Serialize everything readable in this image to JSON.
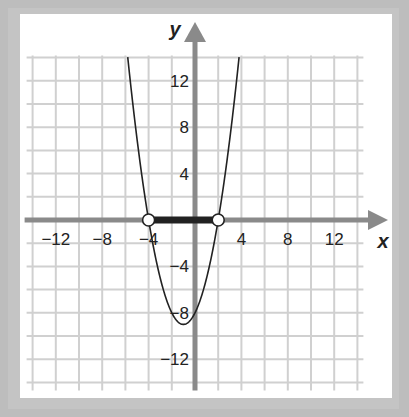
{
  "chart_data": {
    "type": "line",
    "title": "",
    "function": "y = x^2 + 2x - 8",
    "xlabel": "x",
    "ylabel": "y",
    "xlim": [
      -14,
      14
    ],
    "ylim": [
      -14,
      14
    ],
    "grid": true,
    "grid_step": 2,
    "x_ticks": [
      {
        "value": -12,
        "label": "−12"
      },
      {
        "value": -8,
        "label": "−8"
      },
      {
        "value": -4,
        "label": "−4"
      },
      {
        "value": 4,
        "label": "4"
      },
      {
        "value": 8,
        "label": "8"
      },
      {
        "value": 12,
        "label": "12"
      }
    ],
    "y_ticks": [
      {
        "value": 12,
        "label": "12"
      },
      {
        "value": 8,
        "label": "8"
      },
      {
        "value": 4,
        "label": "4"
      },
      {
        "value": -4,
        "label": "−4"
      },
      {
        "value": -8,
        "label": "−8"
      },
      {
        "value": -12,
        "label": "−12"
      }
    ],
    "series": [
      {
        "name": "parabola",
        "vertex": [
          -1,
          -9
        ],
        "roots": [
          -4,
          2
        ],
        "x_range": [
          -5.8,
          3.8
        ]
      }
    ],
    "annotations": [
      {
        "type": "open-circle",
        "x": -4,
        "y": 0
      },
      {
        "type": "open-circle",
        "x": 2,
        "y": 0
      },
      {
        "type": "highlighted-interval",
        "from": -4,
        "to": 2,
        "on": "x-axis"
      }
    ],
    "colors": {
      "axis": "#8a8a8a",
      "grid": "#d0d0d0",
      "curve": "#222222",
      "interval": "#222222",
      "background": "#bdbdbd"
    }
  }
}
